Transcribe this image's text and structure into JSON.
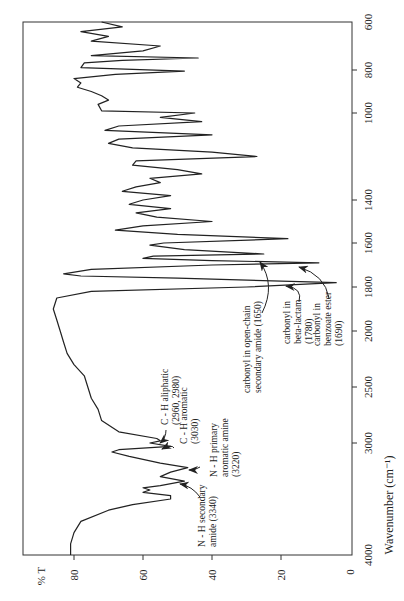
{
  "chart_data": {
    "type": "line",
    "title": "",
    "orientation": "rotated 90 degrees counter-clockwise (wavenumber axis vertical at right, %T axis horizontal at bottom)",
    "xlabel": "Wavenumber (cm⁻¹)",
    "ylabel": "% T",
    "x_ticks": [
      4000,
      3000,
      2500,
      2000,
      1800,
      1600,
      1400,
      1000,
      800,
      600
    ],
    "y_ticks": [
      0,
      20,
      40,
      60,
      80
    ],
    "xlim": [
      4000,
      600
    ],
    "ylim": [
      0,
      90
    ],
    "grid": false,
    "legend": null,
    "series": [
      {
        "name": "IR spectrum",
        "points": [
          [
            4000,
            81
          ],
          [
            3900,
            81
          ],
          [
            3800,
            80
          ],
          [
            3700,
            78
          ],
          [
            3600,
            70
          ],
          [
            3550,
            63
          ],
          [
            3500,
            52
          ],
          [
            3470,
            52
          ],
          [
            3440,
            60
          ],
          [
            3420,
            58
          ],
          [
            3400,
            60
          ],
          [
            3380,
            55
          ],
          [
            3340,
            48
          ],
          [
            3300,
            55
          ],
          [
            3260,
            52
          ],
          [
            3220,
            47
          ],
          [
            3180,
            55
          ],
          [
            3120,
            64
          ],
          [
            3080,
            69
          ],
          [
            3060,
            67
          ],
          [
            3030,
            52
          ],
          [
            3000,
            58
          ],
          [
            2980,
            55
          ],
          [
            2960,
            56
          ],
          [
            2900,
            67
          ],
          [
            2800,
            72
          ],
          [
            2700,
            73
          ],
          [
            2600,
            75
          ],
          [
            2500,
            76
          ],
          [
            2400,
            77
          ],
          [
            2300,
            80
          ],
          [
            2200,
            82
          ],
          [
            2100,
            83
          ],
          [
            2000,
            84
          ],
          [
            1950,
            85
          ],
          [
            1900,
            86
          ],
          [
            1850,
            85
          ],
          [
            1820,
            75
          ],
          [
            1800,
            30
          ],
          [
            1780,
            4
          ],
          [
            1760,
            50
          ],
          [
            1750,
            78
          ],
          [
            1740,
            83
          ],
          [
            1720,
            75
          ],
          [
            1700,
            40
          ],
          [
            1690,
            9
          ],
          [
            1680,
            40
          ],
          [
            1670,
            60
          ],
          [
            1660,
            57
          ],
          [
            1650,
            25
          ],
          [
            1630,
            48
          ],
          [
            1610,
            58
          ],
          [
            1600,
            54
          ],
          [
            1580,
            18
          ],
          [
            1560,
            50
          ],
          [
            1540,
            68
          ],
          [
            1520,
            60
          ],
          [
            1500,
            40
          ],
          [
            1480,
            56
          ],
          [
            1460,
            62
          ],
          [
            1440,
            52
          ],
          [
            1420,
            64
          ],
          [
            1400,
            60
          ],
          [
            1380,
            52
          ],
          [
            1360,
            66
          ],
          [
            1340,
            62
          ],
          [
            1320,
            55
          ],
          [
            1300,
            58
          ],
          [
            1280,
            43
          ],
          [
            1260,
            50
          ],
          [
            1240,
            63
          ],
          [
            1220,
            62
          ],
          [
            1200,
            27
          ],
          [
            1180,
            40
          ],
          [
            1160,
            63
          ],
          [
            1140,
            70
          ],
          [
            1120,
            67
          ],
          [
            1100,
            40
          ],
          [
            1080,
            71
          ],
          [
            1060,
            67
          ],
          [
            1040,
            43
          ],
          [
            1020,
            55
          ],
          [
            1000,
            45
          ],
          [
            990,
            72
          ],
          [
            960,
            73
          ],
          [
            940,
            70
          ],
          [
            920,
            72
          ],
          [
            900,
            75
          ],
          [
            880,
            79
          ],
          [
            860,
            78
          ],
          [
            840,
            80
          ],
          [
            820,
            68
          ],
          [
            805,
            48
          ],
          [
            790,
            78
          ],
          [
            770,
            77
          ],
          [
            760,
            66
          ],
          [
            750,
            44
          ],
          [
            740,
            75
          ],
          [
            720,
            60
          ],
          [
            700,
            55
          ],
          [
            680,
            75
          ],
          [
            660,
            70
          ],
          [
            640,
            78
          ],
          [
            620,
            66
          ],
          [
            600,
            72
          ]
        ]
      }
    ],
    "annotations": [
      {
        "text": "N - H secondary amide (3340)",
        "x": 3340,
        "y": 48
      },
      {
        "text": "N - H primary aromatic amine (3220)",
        "x": 3220,
        "y": 47
      },
      {
        "text": "C - H aromatic (3030)",
        "x": 3030,
        "y": 52
      },
      {
        "text": "C - H aliphatic (2960, 2980)",
        "x": 2970,
        "y": 56
      },
      {
        "text": "carbonyl in open-chain secondary amide (1650)",
        "x": 1650,
        "y": 25
      },
      {
        "text": "carbonyl in beta-lactam (1780)",
        "x": 1780,
        "y": 4
      },
      {
        "text": "carbonyl in benzoate ester (1690)",
        "x": 1690,
        "y": 9
      }
    ]
  },
  "axes": {
    "ylabel": "% T",
    "xlabel": "Wavenumber (cm⁻¹)",
    "pct_ticks": [
      "80",
      "60",
      "40",
      "20",
      "0"
    ],
    "wn_ticks": [
      "600",
      "800",
      "1000",
      "1400",
      "1600",
      "1800",
      "2000",
      "2500",
      "3000",
      "4000"
    ]
  },
  "labels": {
    "nh_secondary": [
      "N - H secondary",
      "amide (3340)"
    ],
    "nh_primary": [
      "N - H primary",
      "aromatic amine",
      "(3220)"
    ],
    "ch_aromatic": [
      "C - H aromatic",
      "(3030)"
    ],
    "ch_aliphatic": [
      "C - H aliphatic",
      "(2960, 2980)"
    ],
    "co_amide": [
      "carbonyl in open-chain",
      "secondary amide (1650)"
    ],
    "co_lactam": [
      "carbonyl in",
      "beta-lactam",
      "(1780)"
    ],
    "co_ester": [
      "carbonyl in",
      "benzoate ester",
      "(1690)"
    ]
  }
}
